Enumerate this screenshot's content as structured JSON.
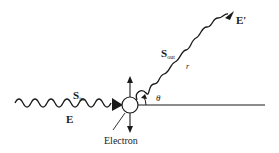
{
  "diagram": {
    "labels": {
      "incident_field": "E",
      "incident_poynting": "S",
      "incident_poynting_sub": "in",
      "scattered_poynting": "S",
      "scattered_poynting_sub": "out",
      "distance": "r",
      "scattered_field": "E′",
      "angle": "θ",
      "particle": "Electron"
    },
    "colors": {
      "ink": "#1a1a1a",
      "background": "#ffffff"
    }
  }
}
